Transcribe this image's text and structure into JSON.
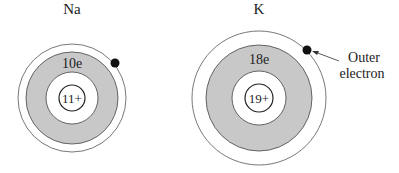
{
  "atoms": [
    {
      "symbol": "Na",
      "inner_shell_label": "10e",
      "nucleus_label": "11+",
      "outer_electrons": 1
    },
    {
      "symbol": "K",
      "inner_shell_label": "18e",
      "nucleus_label": "19+",
      "outer_electrons": 1
    }
  ],
  "annotation": {
    "line1": "Outer",
    "line2": "electron"
  },
  "colors": {
    "shell_fill": "#c8c8c8",
    "stroke": "#333333",
    "electron": "#111111"
  }
}
